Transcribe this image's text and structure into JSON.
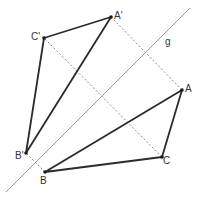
{
  "diagram": {
    "colors": {
      "triangle_stroke": "#2b2b2b",
      "mirror_line": "#9a9a9a",
      "dashed_line": "#8a8a8a",
      "point_fill": "#1a1a1a",
      "label_text": "#333333"
    },
    "mirror_line": {
      "label": "g",
      "x1": 6,
      "y1": 192,
      "x2": 190,
      "y2": 8,
      "label_x": 165,
      "label_y": 37
    },
    "points": {
      "A": {
        "label": "A",
        "x": 182,
        "y": 90,
        "label_x": 185,
        "label_y": 84
      },
      "B": {
        "label": "B",
        "x": 45,
        "y": 172,
        "label_x": 40,
        "label_y": 176
      },
      "C": {
        "label": "C",
        "x": 162,
        "y": 157,
        "label_x": 163,
        "label_y": 156
      },
      "A_prime": {
        "label": "A'",
        "x": 111,
        "y": 17,
        "label_x": 114,
        "label_y": 11
      },
      "B_prime": {
        "label": "B'",
        "x": 26,
        "y": 153,
        "label_x": 15,
        "label_y": 151
      },
      "C_prime": {
        "label": "C'",
        "x": 44,
        "y": 38,
        "label_x": 31,
        "label_y": 32
      }
    },
    "triangles": [
      {
        "name": "ABC",
        "vertices": [
          "A",
          "B",
          "C"
        ]
      },
      {
        "name": "A'B'C'",
        "vertices": [
          "A_prime",
          "B_prime",
          "C_prime"
        ]
      }
    ],
    "dashed_connectors": [
      {
        "from": "A",
        "to": "A_prime"
      },
      {
        "from": "C",
        "to": "C_prime"
      },
      {
        "from": "B",
        "to": "B_prime"
      }
    ]
  }
}
